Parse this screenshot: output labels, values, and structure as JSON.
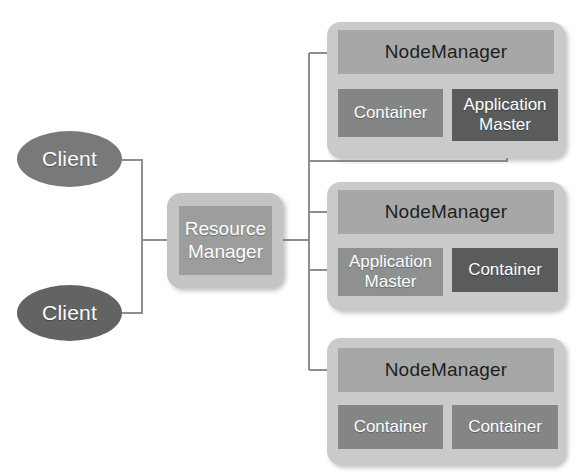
{
  "diagram": {
    "colors": {
      "background": "#ffffff",
      "wire": "#8d8f8e",
      "client_light": "#777a79",
      "client_dark": "#616463",
      "group_box": "#c9cbca",
      "header_bar": "#a5a8a7",
      "tone_light": "#8e918f",
      "tone_medium": "#838685",
      "tone_dark": "#595c5b"
    }
  },
  "clients": [
    {
      "label": "Client",
      "tone": "light"
    },
    {
      "label": "Client",
      "tone": "dark"
    }
  ],
  "resource_manager": {
    "line1": "Resource",
    "line2": "Manager"
  },
  "node_managers": [
    {
      "header": "NodeManager",
      "children": [
        {
          "line1": "Container",
          "line2": "",
          "tone": "medium"
        },
        {
          "line1": "Application",
          "line2": "Master",
          "tone": "dark"
        }
      ]
    },
    {
      "header": "NodeManager",
      "children": [
        {
          "line1": "Application",
          "line2": "Master",
          "tone": "light"
        },
        {
          "line1": "Container",
          "line2": "",
          "tone": "dark"
        }
      ]
    },
    {
      "header": "NodeManager",
      "children": [
        {
          "line1": "Container",
          "line2": "",
          "tone": "medium"
        },
        {
          "line1": "Container",
          "line2": "",
          "tone": "medium"
        }
      ]
    }
  ]
}
